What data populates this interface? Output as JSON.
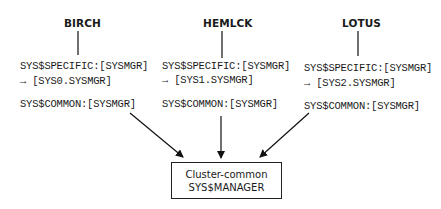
{
  "nodes": [
    {
      "name": "BIRCH",
      "specific": "SYS$SPECIFIC:[SYSMGR]",
      "arrow": "→",
      "root": "[SYS0.SYSMGR]",
      "common": "SYS$COMMON:[SYSMGR]"
    },
    {
      "name": "HEMLCK",
      "specific": "SYS$SPECIFIC:[SYSMGR]",
      "arrow": "→",
      "root": "[SYS1.SYSMGR]",
      "common": "SYS$COMMON:[SYSMGR]"
    },
    {
      "name": "LOTUS",
      "specific": "SYS$SPECIFIC:[SYSMGR]",
      "arrow": "→",
      "root": "[SYS2.SYSMGR]",
      "common": "SYS$COMMON:[SYSMGR]"
    }
  ],
  "target": {
    "line1": "Cluster-common",
    "line2": "SYS$MANAGER"
  }
}
